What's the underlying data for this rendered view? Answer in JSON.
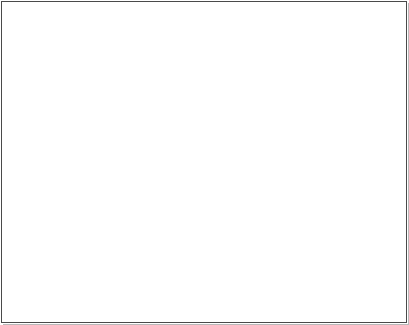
{
  "figure": {
    "panel_tag": "(b)",
    "caption_subject": "pig-carcass-disease-annotation",
    "frame_color": "#4a4a4a",
    "label_color": "#1a1a1a",
    "leader_color": "#5a5a5a"
  },
  "labels": [
    {
      "id": "aujeszkys-tonsils",
      "text": "Aujeszky's - tonsils",
      "y": 15,
      "italic": false,
      "leader_x1": 192,
      "leader_x2": 224,
      "arrow_x": 68,
      "arrow_y": 12
    },
    {
      "id": "foot-conditions",
      "text": "Foot conditions",
      "y": 38,
      "italic": false,
      "leader_x1": 192,
      "leader_x2": 224,
      "arrow_x": 196,
      "arrow_y": 40
    },
    {
      "id": "joint-problems",
      "text": "Joint problems",
      "y": 50,
      "italic": false,
      "leader_x1": 192,
      "leader_x2": 224,
      "arrow_x": 180,
      "arrow_y": 47
    },
    {
      "id": "glassers-disease",
      "text": "Glasser's disease",
      "y": 63,
      "italic": false,
      "leader_x1": 192,
      "leader_x2": 224,
      "arrow_x": 124,
      "arrow_y": 58
    },
    {
      "id": "enzootic-pneumonia",
      "text": "Enzootic (mycoplasma) pneumonia",
      "y": 78,
      "italic": false,
      "leader_x1": 192,
      "leader_x2": 224,
      "arrow_x": 132,
      "arrow_y": 72
    },
    {
      "id": "actinobacillus-pneumonia",
      "text": "Actinobacillus pneumonia",
      "y": 92,
      "italic": false,
      "leader_x1": 192,
      "leader_x2": 224,
      "arrow_x": 133,
      "arrow_y": 80
    },
    {
      "id": "pleurisy",
      "text": "Pleurisy",
      "y": 105,
      "italic": false,
      "leader_x1": 192,
      "leader_x2": 224,
      "arrow_x": 136,
      "arrow_y": 90
    },
    {
      "id": "gastric-ulcer",
      "text": "Gastric ulcer",
      "y": 132,
      "italic": false,
      "leader_x1": 192,
      "leader_x2": 224,
      "arrow_x": 128,
      "arrow_y": 128
    },
    {
      "id": "ascaris-suum",
      "text": "Ascaris suum",
      "y": 145,
      "italic": true,
      "leader_x1": 192,
      "leader_x2": 224,
      "arrow_x": 118,
      "arrow_y": 142
    },
    {
      "id": "peritonitis",
      "text": "Peritonitis",
      "y": 157,
      "italic": false,
      "leader_x1": 192,
      "leader_x2": 224,
      "arrow_x": 110,
      "arrow_y": 152
    },
    {
      "id": "ileitis-proximal-ileum",
      "text": "Ileitis - proximal ileum",
      "y": 182,
      "italic": false,
      "leader_x1": 192,
      "leader_x2": 224,
      "arrow_x": 122,
      "arrow_y": 178
    },
    {
      "id": "pyelonephritis-kidneys",
      "text": "Pyelonephritis (kidneys)",
      "y": 196,
      "italic": false,
      "leader_x1": 192,
      "leader_x2": 224,
      "arrow_x": 150,
      "arrow_y": 200
    },
    {
      "id": "swine-dysentery",
      "text": "Swine dysentery",
      "y": 218,
      "italic": false,
      "leader_x1": 192,
      "leader_x2": 224,
      "arrow_x": 138,
      "arrow_y": 222
    },
    {
      "id": "colitis",
      "text": "Colitis",
      "y": 231,
      "italic": false,
      "leader_x1": 192,
      "leader_x2": 224,
      "arrow_x": 132,
      "arrow_y": 232
    },
    {
      "id": "reproductive-problems",
      "text": "Reproductive problems",
      "y": 252,
      "italic": false,
      "leader_x1": 192,
      "leader_x2": 224,
      "arrow_x": 88,
      "arrow_y": 252
    },
    {
      "id": "cystitis",
      "text": "Cystitis",
      "y": 265,
      "italic": false,
      "leader_x1": 192,
      "leader_x2": 224,
      "arrow_x": 104,
      "arrow_y": 262
    },
    {
      "id": "pcv2-sd",
      "text": "PCV2-SD",
      "y": 278,
      "italic": false,
      "leader_x1": 192,
      "leader_x2": 224,
      "arrow_x": 128,
      "arrow_y": 276
    },
    {
      "id": "anaemia",
      "text": "Anaemia",
      "y": 291,
      "italic": false,
      "leader_x1": 192,
      "leader_x2": 224,
      "arrow_x": 60,
      "arrow_y": 300
    },
    {
      "id": "ocd",
      "text": "OCD",
      "y": 303,
      "italic": false,
      "leader_x1": 212,
      "leader_x2": 224,
      "arrow_x": 198,
      "arrow_y": 303
    }
  ]
}
